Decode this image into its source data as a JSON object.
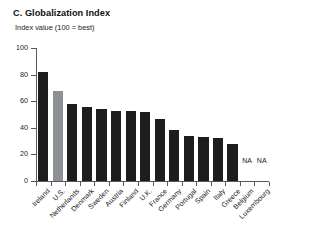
{
  "title": "C. Globalization Index",
  "subtitle": "Index value (100 = best)",
  "colors": {
    "bar": "#1d1d1d",
    "highlight": "#8d9094",
    "axis": "#55595c",
    "background": "#ffffff"
  },
  "na_text": "NA",
  "chart_data": {
    "type": "bar",
    "title": "C. Globalization Index",
    "subtitle": "Index value (100 = best)",
    "xlabel": "",
    "ylabel": "Index value (100 = best)",
    "ylim": [
      0,
      100
    ],
    "yticks": [
      0,
      20,
      40,
      60,
      80,
      100
    ],
    "ytick_labels": [
      "0",
      "20",
      "40",
      "60",
      "80",
      "100"
    ],
    "grid": false,
    "legend": "none",
    "highlight_category": "U.S.",
    "missing_label": "NA",
    "categories": [
      "Ireland",
      "U.S.",
      "Netherlands",
      "Denmark",
      "Sweden",
      "Austria",
      "Finland",
      "U.K.",
      "France",
      "Germany",
      "Portugal",
      "Spain",
      "Italy",
      "Greece",
      "Belgium",
      "Luxembourg"
    ],
    "values": [
      82,
      68,
      58,
      56,
      54,
      53,
      53,
      52,
      47,
      38,
      34,
      33,
      32,
      28,
      25,
      null
    ],
    "series": [
      {
        "name": "Globalization Index",
        "values": [
          82,
          68,
          58,
          56,
          54,
          53,
          53,
          52,
          47,
          38,
          34,
          33,
          32,
          28,
          25,
          null
        ]
      }
    ],
    "points": [
      {
        "category": "Ireland",
        "value": 82,
        "highlight": false,
        "na": false
      },
      {
        "category": "U.S.",
        "value": 68,
        "highlight": true,
        "na": false
      },
      {
        "category": "Netherlands",
        "value": 58,
        "highlight": false,
        "na": false
      },
      {
        "category": "Denmark",
        "value": 56,
        "highlight": false,
        "na": false
      },
      {
        "category": "Sweden",
        "value": 54,
        "highlight": false,
        "na": false
      },
      {
        "category": "Austria",
        "value": 53,
        "highlight": false,
        "na": false
      },
      {
        "category": "Finland",
        "value": 53,
        "highlight": false,
        "na": false
      },
      {
        "category": "U.K.",
        "value": 52,
        "highlight": false,
        "na": false
      },
      {
        "category": "France",
        "value": 47,
        "highlight": false,
        "na": false
      },
      {
        "category": "Germany",
        "value": 38,
        "highlight": false,
        "na": false
      },
      {
        "category": "Portugal",
        "value": 34,
        "highlight": false,
        "na": false
      },
      {
        "category": "Spain",
        "value": 33,
        "highlight": false,
        "na": false
      },
      {
        "category": "Italy",
        "value": 32,
        "highlight": false,
        "na": false
      },
      {
        "category": "Greece",
        "value": 28,
        "highlight": false,
        "na": false
      },
      {
        "category": "Belgium",
        "value": null,
        "highlight": false,
        "na": true
      },
      {
        "category": "Luxembourg",
        "value": null,
        "highlight": false,
        "na": true
      }
    ]
  }
}
